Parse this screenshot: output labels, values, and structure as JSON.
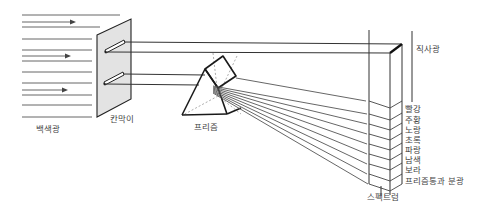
{
  "diagram": {
    "labels": {
      "white_light": "백색광",
      "partition": "칸막이",
      "prism": "프리즘",
      "direct_light": "직사광",
      "spectrum": "스펙트럼",
      "dispersed_caption": "프리즘통과 분광"
    },
    "spectrum_colors": [
      {
        "label": "빨강",
        "name": "red"
      },
      {
        "label": "주황",
        "name": "orange"
      },
      {
        "label": "노랑",
        "name": "yellow"
      },
      {
        "label": "초록",
        "name": "green"
      },
      {
        "label": "파랑",
        "name": "blue"
      },
      {
        "label": "남색",
        "name": "indigo"
      },
      {
        "label": "보라",
        "name": "violet"
      }
    ],
    "colors": {
      "line": "#333333",
      "partition_fill": "#e3e3e3",
      "background": "#ffffff"
    }
  }
}
